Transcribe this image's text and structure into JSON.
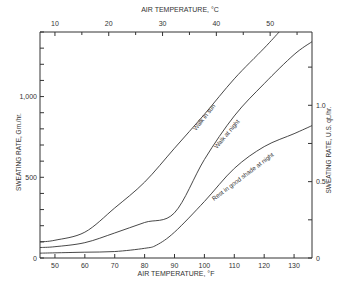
{
  "chart_data": {
    "type": "line",
    "title": "",
    "xlabel": "AIR TEMPERATURE, °F",
    "x2label": "AIR TEMPERATURE, °C",
    "ylabel": "SWEATING RATE, Gm./hr.",
    "y2label": "SWEATING RATE, U.S. qt./hr.",
    "xlim": [
      45,
      136
    ],
    "ylim": [
      0,
      1400
    ],
    "xticks": [
      50,
      60,
      70,
      80,
      90,
      100,
      110,
      120,
      130
    ],
    "x2ticks": [
      10,
      20,
      30,
      40,
      50
    ],
    "x2minor_ticks": [
      15,
      25,
      35,
      45,
      55
    ],
    "yticks_labeled": [
      0,
      500,
      1000
    ],
    "yticks_minor_step": 100,
    "y2ticks_labeled": [
      0,
      0.5,
      1.0
    ],
    "y2ticks_minor": [
      0.25,
      0.75,
      1.25
    ],
    "y2_grams_per_unit": 946,
    "grid": false,
    "legend": "inline labels along curves",
    "series": [
      {
        "name": "Walk in sun",
        "x": [
          45,
          50,
          60,
          70,
          80,
          90,
          100,
          110,
          120,
          125
        ],
        "values": [
          100,
          110,
          160,
          310,
          470,
          680,
          890,
          1110,
          1300,
          1400
        ]
      },
      {
        "name": "Walk at night",
        "x": [
          45,
          50,
          60,
          70,
          80,
          90,
          100,
          110,
          120,
          130,
          136
        ],
        "values": [
          65,
          70,
          95,
          155,
          220,
          280,
          610,
          880,
          1080,
          1260,
          1340
        ]
      },
      {
        "name": "Rest in good shade at night",
        "x": [
          45,
          50,
          60,
          70,
          80,
          84,
          90,
          100,
          110,
          120,
          130,
          136
        ],
        "values": [
          30,
          32,
          36,
          40,
          60,
          80,
          160,
          350,
          555,
          690,
          770,
          820
        ]
      }
    ]
  },
  "labels": {
    "x_bottom": "AIR TEMPERATURE, °F",
    "x_top": "AIR TEMPERATURE, °C",
    "y_left": "SWEATING RATE, Gm./hr.",
    "y_right": "SWEATING RATE, U.S. qt./hr.",
    "curve_sun": "Walk in sun",
    "curve_night": "Walk at night",
    "curve_rest": "Rest in good shade at night"
  }
}
